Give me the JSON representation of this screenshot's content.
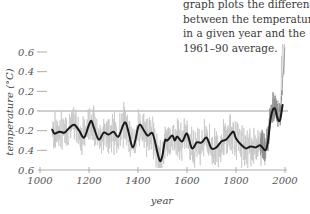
{
  "caption": {
    "lines": [
      "graph plots the difference",
      "between the temperature",
      "in a given year and the",
      "1961–90 average."
    ]
  },
  "chart_data": {
    "type": "line",
    "title": "",
    "xlabel": "year",
    "ylabel": "temperature (°C)",
    "xlim": [
      1000,
      2000
    ],
    "ylim": [
      -0.6,
      0.6
    ],
    "x_ticks": [
      1000,
      1200,
      1400,
      1600,
      1800,
      2000
    ],
    "x_tick_labels": [
      "1000",
      "1200",
      "1400",
      "1600",
      "1800",
      "2000"
    ],
    "y_ticks": [
      0.6,
      0.4,
      0.2,
      0.0,
      -0.2,
      -0.4,
      -0.6
    ],
    "y_tick_labels": [
      "0.6",
      "0.4",
      "0.2",
      "0.0",
      "-0.2",
      "0.4",
      "0.6"
    ],
    "reference_line": {
      "y": 0.0,
      "label": "1961–90 average"
    },
    "grid": false,
    "legend": null,
    "series": [
      {
        "name": "smoothed reconstruction",
        "style": "thick black line",
        "x": [
          1050,
          1060,
          1080,
          1100,
          1120,
          1140,
          1160,
          1180,
          1200,
          1210,
          1220,
          1240,
          1260,
          1280,
          1300,
          1320,
          1340,
          1350,
          1360,
          1380,
          1400,
          1410,
          1420,
          1440,
          1460,
          1480,
          1490,
          1500,
          1510,
          1520,
          1540,
          1550,
          1560,
          1580,
          1600,
          1620,
          1640,
          1660,
          1680,
          1700,
          1720,
          1740,
          1760,
          1780,
          1790,
          1800,
          1820,
          1840,
          1860,
          1880,
          1900,
          1920,
          1930,
          1940,
          1950,
          1960,
          1970,
          1980,
          1990
        ],
        "values": [
          -0.19,
          -0.23,
          -0.21,
          -0.22,
          -0.17,
          -0.14,
          -0.2,
          -0.27,
          -0.14,
          -0.1,
          -0.17,
          -0.29,
          -0.22,
          -0.24,
          -0.21,
          -0.26,
          -0.14,
          -0.12,
          -0.2,
          -0.37,
          -0.17,
          -0.14,
          -0.18,
          -0.25,
          -0.23,
          -0.43,
          -0.51,
          -0.45,
          -0.3,
          -0.3,
          -0.25,
          -0.3,
          -0.26,
          -0.31,
          -0.23,
          -0.38,
          -0.32,
          -0.32,
          -0.27,
          -0.38,
          -0.37,
          -0.31,
          -0.29,
          -0.23,
          -0.21,
          -0.28,
          -0.34,
          -0.38,
          -0.36,
          -0.37,
          -0.35,
          -0.4,
          -0.32,
          -0.1,
          0.01,
          0.02,
          -0.08,
          -0.09,
          0.06
        ]
      },
      {
        "name": "annual values",
        "style": "thin gray line",
        "note": "noisy annual series spanning roughly -0.55 to 0.05 before 1900, rising to ~0.65 by 2000",
        "x": [
          1050,
          1100,
          1150,
          1200,
          1250,
          1300,
          1350,
          1400,
          1450,
          1500,
          1550,
          1600,
          1650,
          1700,
          1750,
          1800,
          1850,
          1900,
          1920,
          1940,
          1960,
          1980,
          2000
        ],
        "values": [
          -0.2,
          -0.22,
          -0.15,
          -0.12,
          -0.25,
          -0.22,
          -0.15,
          -0.18,
          -0.25,
          -0.48,
          -0.28,
          -0.25,
          -0.32,
          -0.37,
          -0.3,
          -0.22,
          -0.36,
          -0.37,
          -0.42,
          -0.05,
          0.18,
          0.2,
          0.65
        ]
      }
    ]
  }
}
